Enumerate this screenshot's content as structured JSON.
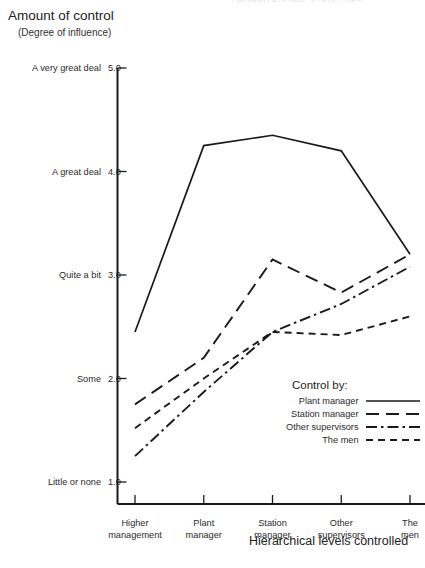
{
  "header": {
    "clipped_top_text": "ORGANIZATIONAL STRUCTURE"
  },
  "titles": {
    "y_axis_title": "Amount of control",
    "y_axis_subtitle": "(Degree of influence)",
    "x_axis_title": "Hierarchical levels controlled"
  },
  "legend": {
    "title": "Control by:",
    "items": [
      {
        "label": "Plant manager",
        "style": "solid"
      },
      {
        "label": "Station manager",
        "style": "long-dash"
      },
      {
        "label": "Other supervisors",
        "style": "dash-dot"
      },
      {
        "label": "The men",
        "style": "dash"
      }
    ]
  },
  "chart_data": {
    "type": "line",
    "title": "Amount of control",
    "subtitle": "(Degree of influence)",
    "xlabel": "Hierarchical levels controlled",
    "ylabel": "Amount of control (Degree of influence)",
    "categories": [
      "Higher management",
      "Plant manager",
      "Station manager",
      "Other supervisors",
      "The men"
    ],
    "ylim": [
      1.0,
      5.0
    ],
    "yticks": [
      1.0,
      2.0,
      3.0,
      4.0,
      5.0
    ],
    "ytick_labels": [
      {
        "value": "1.0",
        "name": "Little or none"
      },
      {
        "value": "2.0",
        "name": "Some"
      },
      {
        "value": "3.0",
        "name": "Quite a bit"
      },
      {
        "value": "4.0",
        "name": "A great deal"
      },
      {
        "value": "5.0",
        "name": "A very great deal"
      }
    ],
    "grid": false,
    "legend_position": "inside lower-right",
    "series": [
      {
        "name": "Plant manager",
        "style": "solid",
        "values": [
          2.45,
          4.25,
          4.35,
          4.2,
          3.2
        ]
      },
      {
        "name": "Station manager",
        "style": "long-dash",
        "values": [
          1.75,
          2.2,
          3.15,
          2.83,
          3.2
        ]
      },
      {
        "name": "Other supervisors",
        "style": "dash-dot",
        "values": [
          1.25,
          1.87,
          2.45,
          2.72,
          3.08
        ]
      },
      {
        "name": "The men",
        "style": "dash",
        "values": [
          1.52,
          2.0,
          2.45,
          2.42,
          2.6
        ]
      }
    ]
  },
  "colors": {
    "ink": "#1a1a1a",
    "background": "#ffffff"
  }
}
